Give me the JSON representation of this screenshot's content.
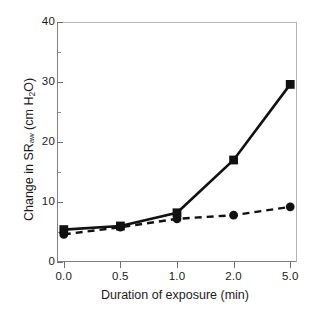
{
  "chart_data": {
    "type": "line",
    "title": "",
    "xlabel": "Duration of exposure (min)",
    "ylabel": "Change in SRaw (cm H2O)",
    "ylabel_parts": {
      "prefix": "Change in SR",
      "subscript": "aw",
      "suffix": " (cm H"
    },
    "ylabel_units_sub": "2",
    "ylabel_units_tail": "O)",
    "categories": [
      "0.0",
      "0.5",
      "1.0",
      "2.0",
      "5.0"
    ],
    "x_positions": [
      0,
      1,
      2,
      3,
      4
    ],
    "ylim": [
      0,
      40
    ],
    "xlim": [
      -0.12,
      4.12
    ],
    "yticks": [
      0,
      10,
      20,
      30,
      40
    ],
    "ytick_labels": [
      "0",
      "10",
      "20",
      "30",
      "40"
    ],
    "yminor_ticks": [
      5,
      15,
      25,
      35
    ],
    "grid": false,
    "legend": "none",
    "series": [
      {
        "name": "solid-square-series",
        "linestyle": "solid",
        "marker": "square",
        "color": "#111111",
        "values": [
          5.4,
          6.0,
          8.2,
          17.0,
          29.6
        ]
      },
      {
        "name": "dashed-circle-series",
        "linestyle": "dashed",
        "marker": "circle",
        "color": "#111111",
        "values": [
          4.6,
          5.8,
          7.2,
          7.8,
          9.2
        ]
      }
    ]
  },
  "colors": {
    "ink": "#111111",
    "axis": "#6e6e6e",
    "frame_light": "#b4b4b4",
    "background": "#ffffff"
  }
}
